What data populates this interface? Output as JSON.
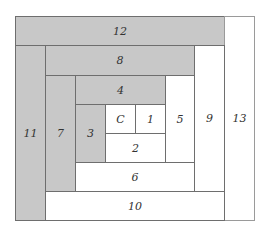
{
  "diagram": {
    "type": "log-cabin quilt block piecing order",
    "colors": {
      "dark": "#c8c8c8",
      "light": "#ffffff",
      "line": "#6e6e6e"
    },
    "pieces": [
      {
        "label": "12",
        "shade": "dark",
        "x": 15,
        "y": 16,
        "w": 210,
        "h": 30
      },
      {
        "label": "13",
        "shade": "light",
        "x": 224,
        "y": 16,
        "w": 31,
        "h": 205
      },
      {
        "label": "11",
        "shade": "dark",
        "x": 15,
        "y": 45,
        "w": 31,
        "h": 176
      },
      {
        "label": "8",
        "shade": "dark",
        "x": 45,
        "y": 45,
        "w": 150,
        "h": 31
      },
      {
        "label": "9",
        "shade": "light",
        "x": 194,
        "y": 45,
        "w": 31,
        "h": 147
      },
      {
        "label": "10",
        "shade": "light",
        "x": 45,
        "y": 191,
        "w": 180,
        "h": 30
      },
      {
        "label": "7",
        "shade": "dark",
        "x": 45,
        "y": 75,
        "w": 31,
        "h": 117
      },
      {
        "label": "4",
        "shade": "dark",
        "x": 75,
        "y": 75,
        "w": 91,
        "h": 30
      },
      {
        "label": "5",
        "shade": "light",
        "x": 165,
        "y": 75,
        "w": 30,
        "h": 88
      },
      {
        "label": "6",
        "shade": "light",
        "x": 75,
        "y": 162,
        "w": 120,
        "h": 30
      },
      {
        "label": "3",
        "shade": "dark",
        "x": 75,
        "y": 104,
        "w": 31,
        "h": 59
      },
      {
        "label": "C",
        "shade": "light",
        "x": 105,
        "y": 104,
        "w": 31,
        "h": 30
      },
      {
        "label": "1",
        "shade": "light",
        "x": 135,
        "y": 104,
        "w": 31,
        "h": 30
      },
      {
        "label": "2",
        "shade": "light",
        "x": 105,
        "y": 133,
        "w": 61,
        "h": 30
      }
    ]
  }
}
